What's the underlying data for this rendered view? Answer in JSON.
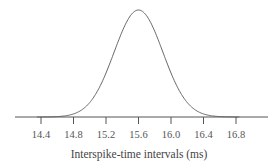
{
  "chart_data": {
    "type": "line",
    "title": "",
    "xlabel": "Interspike-time intervals (ms)",
    "ylabel": "",
    "xlim": [
      14.2,
      17.2
    ],
    "ylim": [
      0,
      1
    ],
    "grid": false,
    "legend": null,
    "x_ticks": [
      "14.4",
      "14.8",
      "15.2",
      "15.6",
      "16.0",
      "16.4",
      "16.8"
    ],
    "distribution": "normal",
    "mean": 15.6,
    "std_dev": 0.3,
    "series": [
      {
        "name": "normal density",
        "x": [
          14.4,
          14.6,
          14.8,
          15.0,
          15.2,
          15.4,
          15.6,
          15.8,
          16.0,
          16.2,
          16.4,
          16.6,
          16.8
        ],
        "values": [
          0.0003,
          0.004,
          0.029,
          0.135,
          0.411,
          0.801,
          1.0,
          0.801,
          0.411,
          0.135,
          0.029,
          0.004,
          0.0003
        ]
      }
    ],
    "colors": {
      "curve": "#666666",
      "axis": "#555555"
    }
  }
}
